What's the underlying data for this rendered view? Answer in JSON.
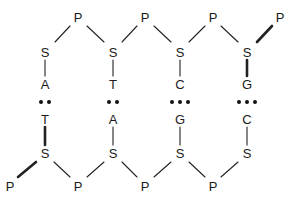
{
  "diagram": {
    "top_strand": {
      "phosphates": [
        {
          "label": "P",
          "x": 78,
          "y": 17
        },
        {
          "label": "P",
          "x": 145,
          "y": 17
        },
        {
          "label": "P",
          "x": 213,
          "y": 17
        },
        {
          "label": "P",
          "x": 280,
          "y": 17
        }
      ],
      "sugars": [
        {
          "label": "S",
          "x": 45,
          "y": 52
        },
        {
          "label": "S",
          "x": 113,
          "y": 52
        },
        {
          "label": "S",
          "x": 180,
          "y": 52
        },
        {
          "label": "S",
          "x": 247,
          "y": 52
        }
      ],
      "bases": [
        {
          "label": "A",
          "x": 45,
          "y": 84
        },
        {
          "label": "T",
          "x": 113,
          "y": 84
        },
        {
          "label": "C",
          "x": 180,
          "y": 84
        },
        {
          "label": "G",
          "x": 247,
          "y": 84
        }
      ]
    },
    "hydrogen_bonds": [
      {
        "pair": "A-T",
        "count": 2,
        "x": 45,
        "y": 102
      },
      {
        "pair": "T-A",
        "count": 2,
        "x": 113,
        "y": 102
      },
      {
        "pair": "C-G",
        "count": 3,
        "x": 180,
        "y": 102
      },
      {
        "pair": "G-C",
        "count": 3,
        "x": 247,
        "y": 102
      }
    ],
    "bottom_strand": {
      "bases": [
        {
          "label": "T",
          "x": 45,
          "y": 119
        },
        {
          "label": "A",
          "x": 113,
          "y": 119
        },
        {
          "label": "G",
          "x": 180,
          "y": 119
        },
        {
          "label": "C",
          "x": 247,
          "y": 119
        }
      ],
      "sugars": [
        {
          "label": "S",
          "x": 45,
          "y": 153
        },
        {
          "label": "S",
          "x": 113,
          "y": 153
        },
        {
          "label": "S",
          "x": 180,
          "y": 153
        },
        {
          "label": "S",
          "x": 247,
          "y": 153
        }
      ],
      "phosphates": [
        {
          "label": "P",
          "x": 10,
          "y": 186
        },
        {
          "label": "P",
          "x": 78,
          "y": 186
        },
        {
          "label": "P",
          "x": 145,
          "y": 186
        },
        {
          "label": "P",
          "x": 213,
          "y": 186
        }
      ]
    },
    "colors": {
      "text": "#1a1a1a",
      "lines": "#222222",
      "background": "#ffffff"
    }
  }
}
